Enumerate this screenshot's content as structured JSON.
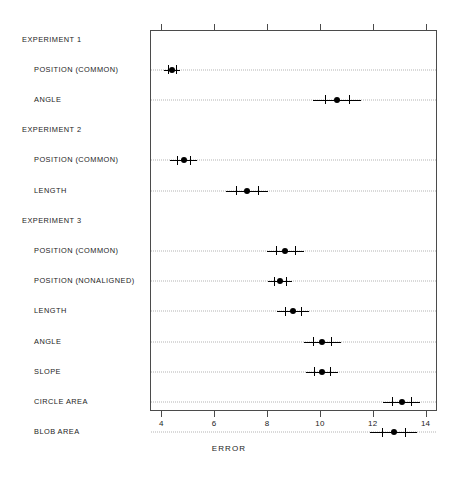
{
  "chart_data": {
    "type": "scatter",
    "title": "",
    "xlabel": "ERROR",
    "ylabel": "",
    "xlim": [
      3.57,
      14.43
    ],
    "ticks": [
      4,
      6,
      8,
      10,
      12,
      14
    ],
    "grid": true,
    "legend": null,
    "orientation": "horizontal",
    "rows": [
      {
        "kind": "group",
        "label": "EXPERIMENT 1"
      },
      {
        "kind": "point",
        "label": "POSITION (COMMON)",
        "value": 4.35,
        "low": 4.05,
        "high": 4.65,
        "cap_low": 4.2,
        "cap_high": 4.5
      },
      {
        "kind": "point",
        "label": "ANGLE",
        "value": 10.6,
        "low": 9.7,
        "high": 11.5,
        "cap_low": 10.15,
        "cap_high": 11.05
      },
      {
        "kind": "group",
        "label": "EXPERIMENT 2"
      },
      {
        "kind": "point",
        "label": "POSITION (COMMON)",
        "value": 4.8,
        "low": 4.3,
        "high": 5.3,
        "cap_low": 4.55,
        "cap_high": 5.05
      },
      {
        "kind": "point",
        "label": "LENGTH",
        "value": 7.2,
        "low": 6.4,
        "high": 8.0,
        "cap_low": 6.8,
        "cap_high": 7.6
      },
      {
        "kind": "group",
        "label": "EXPERIMENT 3"
      },
      {
        "kind": "point",
        "label": "POSITION (COMMON)",
        "value": 8.65,
        "low": 7.95,
        "high": 9.35,
        "cap_low": 8.3,
        "cap_high": 9.0
      },
      {
        "kind": "point",
        "label": "POSITION (NONALIGNED)",
        "value": 8.45,
        "low": 8.0,
        "high": 8.9,
        "cap_low": 8.22,
        "cap_high": 8.68
      },
      {
        "kind": "point",
        "label": "LENGTH",
        "value": 8.95,
        "low": 8.35,
        "high": 9.55,
        "cap_low": 8.65,
        "cap_high": 9.25
      },
      {
        "kind": "point",
        "label": "ANGLE",
        "value": 10.05,
        "low": 9.35,
        "high": 10.75,
        "cap_low": 9.7,
        "cap_high": 10.4
      },
      {
        "kind": "point",
        "label": "SLOPE",
        "value": 10.05,
        "low": 9.45,
        "high": 10.65,
        "cap_low": 9.75,
        "cap_high": 10.35
      },
      {
        "kind": "point",
        "label": "CIRCLE AREA",
        "value": 13.05,
        "low": 12.35,
        "high": 13.75,
        "cap_low": 12.7,
        "cap_high": 13.4
      },
      {
        "kind": "point",
        "label": "BLOB AREA",
        "value": 12.75,
        "low": 11.85,
        "high": 13.65,
        "cap_low": 12.3,
        "cap_high": 13.2
      }
    ]
  }
}
